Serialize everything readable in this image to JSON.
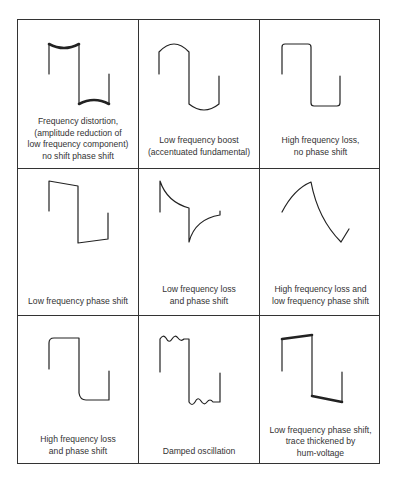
{
  "figure": {
    "grid": {
      "rows": 3,
      "cols": 3
    },
    "cells": [
      {
        "id": "freq-distortion",
        "waveform": "concave-tops-square-wave",
        "caption": [
          "Frequency distortion,",
          "(amplitude reduction of",
          "low frequency component)",
          "no shift phase shift"
        ]
      },
      {
        "id": "low-freq-boost",
        "waveform": "rounded-convex-square-wave",
        "caption": [
          "Low frequency boost",
          "(accentuated fundamental)"
        ]
      },
      {
        "id": "high-freq-loss",
        "waveform": "rounded-corner-square-wave",
        "caption": [
          "High frequency loss,",
          "no phase shift"
        ]
      },
      {
        "id": "low-freq-phase-shift",
        "waveform": "tilted-square-wave",
        "caption": [
          "Low frequency phase shift"
        ]
      },
      {
        "id": "low-freq-loss-phase",
        "waveform": "exponential-decay-square-wave",
        "caption": [
          "Low frequency loss",
          "and phase shift"
        ]
      },
      {
        "id": "high-freq-loss-low-freq-phase",
        "waveform": "sawtooth-curved-wave",
        "caption": [
          "High frequency loss and",
          "low frequency phase shift"
        ]
      },
      {
        "id": "high-freq-loss-phase",
        "waveform": "rounded-leading-corner-square-wave",
        "caption": [
          "High frequency loss",
          "and phase shift"
        ]
      },
      {
        "id": "damped-oscillation",
        "waveform": "ringing-square-wave",
        "caption": [
          "Damped oscillation"
        ]
      },
      {
        "id": "hum-voltage",
        "waveform": "tilted-thick-square-wave",
        "caption": [
          "Low frequency phase shift,",
          "trace thickened by",
          "hum-voltage"
        ]
      }
    ]
  }
}
